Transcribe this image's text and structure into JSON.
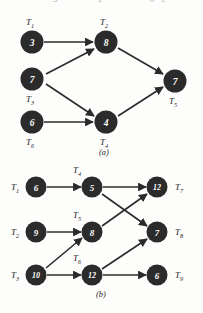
{
  "figure": {
    "top_cutoff_fragments": [
      "3",
      "1",
      "6",
      "1"
    ],
    "panels": [
      {
        "id": "a",
        "caption": "(a)",
        "nodes": [
          {
            "id": "a-t1",
            "task": "T",
            "subscript": "1",
            "value": "3",
            "label_position": "above"
          },
          {
            "id": "a-t2",
            "task": "T",
            "subscript": "2",
            "value": "8",
            "label_position": "above"
          },
          {
            "id": "a-t3",
            "task": "T",
            "subscript": "3",
            "value": "7",
            "label_position": "below"
          },
          {
            "id": "a-t4",
            "task": "T",
            "subscript": "4",
            "value": "4",
            "label_position": "below"
          },
          {
            "id": "a-t5",
            "task": "T",
            "subscript": "5",
            "value": "7",
            "label_position": "below"
          },
          {
            "id": "a-t6",
            "task": "T",
            "subscript": "6",
            "value": "6",
            "label_position": "below"
          }
        ],
        "edges": [
          {
            "from": "a-t1",
            "to": "a-t2"
          },
          {
            "from": "a-t3",
            "to": "a-t2"
          },
          {
            "from": "a-t3",
            "to": "a-t4"
          },
          {
            "from": "a-t6",
            "to": "a-t4"
          },
          {
            "from": "a-t2",
            "to": "a-t5"
          },
          {
            "from": "a-t4",
            "to": "a-t5"
          }
        ]
      },
      {
        "id": "b",
        "caption": "(b)",
        "nodes": [
          {
            "id": "b-t1",
            "task": "T",
            "subscript": "1",
            "value": "6",
            "label_position": "left"
          },
          {
            "id": "b-t2",
            "task": "T",
            "subscript": "2",
            "value": "9",
            "label_position": "left"
          },
          {
            "id": "b-t3",
            "task": "T",
            "subscript": "3",
            "value": "10",
            "label_position": "left"
          },
          {
            "id": "b-t4",
            "task": "T",
            "subscript": "4",
            "value": "5",
            "label_position": "above"
          },
          {
            "id": "b-t5",
            "task": "T",
            "subscript": "5",
            "value": "8",
            "label_position": "above"
          },
          {
            "id": "b-t6",
            "task": "T",
            "subscript": "6",
            "value": "12",
            "label_position": "above"
          },
          {
            "id": "b-t7",
            "task": "T",
            "subscript": "7",
            "value": "12",
            "label_position": "right"
          },
          {
            "id": "b-t8",
            "task": "T",
            "subscript": "8",
            "value": "7",
            "label_position": "right"
          },
          {
            "id": "b-t9",
            "task": "T",
            "subscript": "9",
            "value": "6",
            "label_position": "right"
          }
        ],
        "edges": [
          {
            "from": "b-t1",
            "to": "b-t4"
          },
          {
            "from": "b-t2",
            "to": "b-t5"
          },
          {
            "from": "b-t3",
            "to": "b-t6"
          },
          {
            "from": "b-t3",
            "to": "b-t5"
          },
          {
            "from": "b-t4",
            "to": "b-t7"
          },
          {
            "from": "b-t4",
            "to": "b-t8"
          },
          {
            "from": "b-t5",
            "to": "b-t7"
          },
          {
            "from": "b-t6",
            "to": "b-t8"
          },
          {
            "from": "b-t6",
            "to": "b-t9"
          }
        ]
      }
    ]
  },
  "colors": {
    "node_fill": "#2b2b2b",
    "node_text": "#ffffff",
    "edge": "#2b2b2b",
    "label_text": "#1d1d1d",
    "background": "#fdfdfc"
  }
}
